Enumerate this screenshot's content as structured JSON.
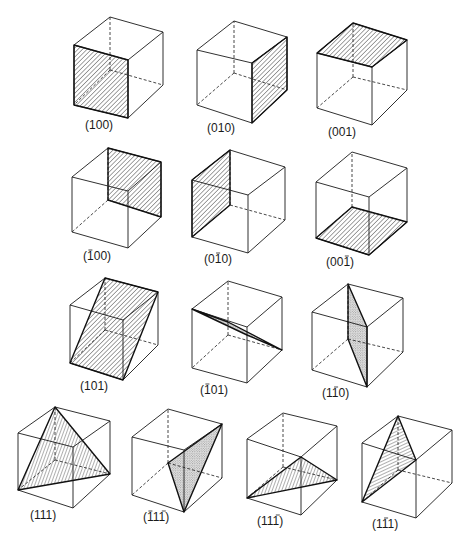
{
  "figure": {
    "title": "",
    "hatch_color": "#1a1a1a",
    "line_color": "#1a1a1a"
  },
  "cubes": [
    {
      "id": "c100",
      "label_parts": [
        {
          "t": "1",
          "bar": false
        },
        {
          "t": "0",
          "bar": false
        },
        {
          "t": "0",
          "bar": false
        }
      ],
      "label_text": "(100)",
      "label_pos": [
        85,
        129
      ],
      "v": {
        "ftl": [
          74,
          45
        ],
        "ftr": [
          128,
          60
        ],
        "fbl": [
          74,
          105
        ],
        "fbr": [
          128,
          118
        ],
        "btl": [
          110,
          17
        ],
        "btr": [
          163,
          32
        ],
        "bbr": [
          163,
          85
        ],
        "h": [
          110,
          70
        ]
      },
      "plane": [
        "ftl",
        "ftr",
        "fbr",
        "fbl"
      ],
      "fill": "hatch"
    },
    {
      "id": "c010",
      "label_parts": [
        {
          "t": "0",
          "bar": false
        },
        {
          "t": "1",
          "bar": false
        },
        {
          "t": "0",
          "bar": false
        }
      ],
      "label_text": "(010)",
      "label_pos": [
        207,
        132
      ],
      "v": {
        "ftl": [
          197,
          50
        ],
        "ftr": [
          252,
          63
        ],
        "fbl": [
          197,
          105
        ],
        "fbr": [
          252,
          123
        ],
        "btl": [
          234,
          21
        ],
        "btr": [
          287,
          37
        ],
        "bbr": [
          287,
          90
        ],
        "h": [
          234,
          73
        ]
      },
      "plane": [
        "ftr",
        "btr",
        "bbr",
        "fbr"
      ],
      "fill": "hatch"
    },
    {
      "id": "c001",
      "label_parts": [
        {
          "t": "0",
          "bar": false
        },
        {
          "t": "0",
          "bar": false
        },
        {
          "t": "1",
          "bar": false
        }
      ],
      "label_text": "(001)",
      "label_pos": [
        328,
        136
      ],
      "v": {
        "ftl": [
          317,
          53
        ],
        "ftr": [
          372,
          67
        ],
        "fbl": [
          317,
          108
        ],
        "fbr": [
          372,
          125
        ],
        "btl": [
          353,
          23
        ],
        "btr": [
          407,
          40
        ],
        "bbr": [
          407,
          90
        ],
        "h": [
          353,
          77
        ]
      },
      "plane": [
        "btl",
        "btr",
        "ftr",
        "ftl"
      ],
      "fill": "hatch"
    },
    {
      "id": "cm100",
      "label_parts": [
        {
          "t": "1",
          "bar": true
        },
        {
          "t": "0",
          "bar": false
        },
        {
          "t": "0",
          "bar": false
        }
      ],
      "label_text": "(1̄00)",
      "label_pos": [
        83,
        260
      ],
      "v": {
        "ftl": [
          72,
          177
        ],
        "ftr": [
          128,
          191
        ],
        "fbl": [
          72,
          232
        ],
        "fbr": [
          128,
          248
        ],
        "btl": [
          108,
          148
        ],
        "btr": [
          161,
          162
        ],
        "bbr": [
          161,
          217
        ],
        "h": [
          108,
          200
        ]
      },
      "plane": [
        "btl",
        "btr",
        "bbr",
        "h"
      ],
      "fill": "hatch"
    },
    {
      "id": "c0m10",
      "label_parts": [
        {
          "t": "0",
          "bar": false
        },
        {
          "t": "1",
          "bar": true
        },
        {
          "t": "0",
          "bar": false
        }
      ],
      "label_text": "(01̄0)",
      "label_pos": [
        204,
        263
      ],
      "v": {
        "ftl": [
          192,
          180
        ],
        "ftr": [
          248,
          195
        ],
        "fbl": [
          192,
          237
        ],
        "fbr": [
          248,
          253
        ],
        "btl": [
          230,
          150
        ],
        "btr": [
          285,
          167
        ],
        "bbr": [
          285,
          220
        ],
        "h": [
          230,
          205
        ]
      },
      "plane": [
        "btl",
        "ftl",
        "fbl",
        "h"
      ],
      "fill": "hatch"
    },
    {
      "id": "c00m1",
      "label_parts": [
        {
          "t": "0",
          "bar": false
        },
        {
          "t": "0",
          "bar": false
        },
        {
          "t": "1",
          "bar": true
        }
      ],
      "label_text": "(001̄)",
      "label_pos": [
        326,
        266
      ],
      "v": {
        "ftl": [
          316,
          182
        ],
        "ftr": [
          369,
          197
        ],
        "fbl": [
          316,
          238
        ],
        "fbr": [
          369,
          255
        ],
        "btl": [
          352,
          152
        ],
        "btr": [
          407,
          168
        ],
        "bbr": [
          407,
          222
        ],
        "h": [
          352,
          207
        ]
      },
      "plane": [
        "h",
        "bbr",
        "fbr",
        "fbl"
      ],
      "fill": "hatch"
    },
    {
      "id": "c101",
      "label_parts": [
        {
          "t": "1",
          "bar": false
        },
        {
          "t": "0",
          "bar": false
        },
        {
          "t": "1",
          "bar": false
        }
      ],
      "label_text": "(101)",
      "label_pos": [
        80,
        390
      ],
      "v": {
        "ftl": [
          70,
          305
        ],
        "ftr": [
          123,
          320
        ],
        "fbl": [
          70,
          363
        ],
        "fbr": [
          123,
          380
        ],
        "btl": [
          105,
          278
        ],
        "btr": [
          158,
          292
        ],
        "bbr": [
          158,
          345
        ],
        "h": [
          105,
          330
        ]
      },
      "plane": [
        "btl",
        "btr",
        "fbr",
        "fbl"
      ],
      "fill": "hatch"
    },
    {
      "id": "cm101",
      "label_parts": [
        {
          "t": "1",
          "bar": true
        },
        {
          "t": "0",
          "bar": false
        },
        {
          "t": "1",
          "bar": false
        }
      ],
      "label_text": "(1̄01)",
      "label_pos": [
        200,
        394
      ],
      "v": {
        "ftl": [
          192,
          309
        ],
        "ftr": [
          247,
          327
        ],
        "fbl": [
          192,
          368
        ],
        "fbr": [
          247,
          383
        ],
        "btl": [
          228,
          281
        ],
        "btr": [
          282,
          297
        ],
        "bbr": [
          282,
          350
        ],
        "h": [
          228,
          335
        ]
      },
      "plane_points": [
        [
          192,
          309
        ],
        [
          228,
          322
        ],
        [
          282,
          350
        ],
        [
          247,
          335
        ]
      ],
      "fill": "stipple"
    },
    {
      "id": "c1m10",
      "label_parts": [
        {
          "t": "1",
          "bar": false
        },
        {
          "t": "1",
          "bar": true
        },
        {
          "t": "0",
          "bar": false
        }
      ],
      "label_text": "(11̄0)",
      "label_pos": [
        322,
        397
      ],
      "v": {
        "ftl": [
          312,
          312
        ],
        "ftr": [
          367,
          327
        ],
        "fbl": [
          312,
          370
        ],
        "fbr": [
          367,
          387
        ],
        "btl": [
          348,
          284
        ],
        "btr": [
          403,
          298
        ],
        "bbr": [
          403,
          352
        ],
        "h": [
          348,
          339
        ]
      },
      "plane": [
        "btl",
        "ftr",
        "fbr",
        "h"
      ],
      "fill": "stipple"
    },
    {
      "id": "c111",
      "label_parts": [
        {
          "t": "1",
          "bar": false
        },
        {
          "t": "1",
          "bar": false
        },
        {
          "t": "1",
          "bar": false
        }
      ],
      "label_text": "(111)",
      "label_pos": [
        30,
        519
      ],
      "v": {
        "ftl": [
          18,
          433
        ],
        "ftr": [
          73,
          447
        ],
        "fbl": [
          18,
          490
        ],
        "fbr": [
          73,
          508
        ],
        "btl": [
          55,
          407
        ],
        "btr": [
          110,
          421
        ],
        "bbr": [
          110,
          474
        ],
        "h": [
          55,
          460
        ]
      },
      "plane": [
        "btl",
        "bbr",
        "fbl"
      ],
      "fill": "hatch-v"
    },
    {
      "id": "cm11m1",
      "label_parts": [
        {
          "t": "1",
          "bar": true
        },
        {
          "t": "1",
          "bar": false
        },
        {
          "t": "1",
          "bar": true
        }
      ],
      "label_text": "(1̄11̄)",
      "label_pos": [
        143,
        521
      ],
      "v": {
        "ftl": [
          132,
          437
        ],
        "ftr": [
          184,
          450
        ],
        "fbl": [
          132,
          495
        ],
        "fbr": [
          184,
          512
        ],
        "btl": [
          168,
          409
        ],
        "btr": [
          222,
          424
        ],
        "bbr": [
          222,
          478
        ],
        "h": [
          168,
          463
        ]
      },
      "plane": [
        "btr",
        "h",
        "fbr"
      ],
      "fill": "stipple"
    },
    {
      "id": "c11m1",
      "label_parts": [
        {
          "t": "1",
          "bar": false
        },
        {
          "t": "1",
          "bar": false
        },
        {
          "t": "1",
          "bar": true
        }
      ],
      "label_text": "(111̄)",
      "label_pos": [
        257,
        525
      ],
      "v": {
        "ftl": [
          247,
          439
        ],
        "ftr": [
          301,
          457
        ],
        "fbl": [
          247,
          498
        ],
        "fbr": [
          301,
          515
        ],
        "btl": [
          283,
          413
        ],
        "btr": [
          337,
          426
        ],
        "bbr": [
          337,
          480
        ],
        "h": [
          283,
          467
        ]
      },
      "plane": [
        "ftr",
        "bbr",
        "fbl"
      ],
      "fill": "hatch-v"
    },
    {
      "id": "c1m11",
      "label_parts": [
        {
          "t": "1",
          "bar": false
        },
        {
          "t": "1",
          "bar": true
        },
        {
          "t": "1",
          "bar": false
        }
      ],
      "label_text": "(11̄1)",
      "label_pos": [
        372,
        528
      ],
      "v": {
        "ftl": [
          362,
          443
        ],
        "ftr": [
          416,
          460
        ],
        "fbl": [
          362,
          502
        ],
        "fbr": [
          416,
          518
        ],
        "btl": [
          398,
          416
        ],
        "btr": [
          452,
          430
        ],
        "bbr": [
          452,
          483
        ],
        "h": [
          398,
          470
        ]
      },
      "plane": [
        "btl",
        "ftr",
        "fbl"
      ],
      "fill": "hatch-h"
    }
  ]
}
